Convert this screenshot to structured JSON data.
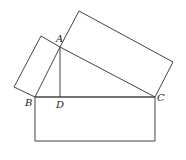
{
  "diagram": {
    "type": "geometry",
    "points": {
      "A": {
        "label": "A",
        "x": 60,
        "y": 47
      },
      "B": {
        "label": "B",
        "x": 35,
        "y": 97
      },
      "C": {
        "label": "C",
        "x": 155,
        "y": 97
      },
      "D": {
        "label": "D",
        "x": 60,
        "y": 97
      }
    },
    "labels": {
      "A": "A",
      "B": "B",
      "C": "C",
      "D": "D"
    },
    "shapes": {
      "bottom_rectangle": [
        [
          35,
          97
        ],
        [
          155,
          97
        ],
        [
          155,
          141
        ],
        [
          35,
          141
        ]
      ],
      "left_rectangle": [
        [
          35,
          97
        ],
        [
          60,
          47
        ],
        [
          41,
          36
        ],
        [
          14,
          87
        ]
      ],
      "right_rectangle": [
        [
          60,
          47
        ],
        [
          155,
          97
        ],
        [
          173,
          62
        ],
        [
          79,
          11
        ]
      ],
      "triangle": [
        [
          60,
          47
        ],
        [
          35,
          97
        ],
        [
          155,
          97
        ]
      ],
      "altitude": [
        [
          60,
          47
        ],
        [
          60,
          97
        ]
      ]
    },
    "stroke_color": "#444444"
  }
}
